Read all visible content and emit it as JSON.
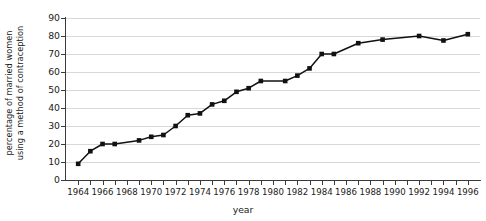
{
  "chart_data": {
    "type": "line",
    "title": "",
    "xlabel": "year",
    "ylabel": "percentage of married women using a method of contraception",
    "ylabel_line1": "percentage of married women",
    "ylabel_line2": "using a method of contraception",
    "xlim": [
      1963,
      1997
    ],
    "ylim": [
      0,
      90
    ],
    "y_ticks": [
      0,
      10,
      20,
      30,
      40,
      50,
      60,
      70,
      80,
      90
    ],
    "x_tick_years": [
      1964,
      1965,
      1966,
      1967,
      1968,
      1969,
      1970,
      1971,
      1972,
      1973,
      1974,
      1975,
      1976,
      1977,
      1978,
      1979,
      1980,
      1981,
      1982,
      1983,
      1984,
      1985,
      1986,
      1987,
      1988,
      1989,
      1990,
      1991,
      1992,
      1993,
      1994,
      1995,
      1996
    ],
    "x_tick_labels": [
      {
        "year": 1964,
        "label": "1964"
      },
      {
        "year": 1966,
        "label": "1966"
      },
      {
        "year": 1968,
        "label": "1968"
      },
      {
        "year": 1970,
        "label": "1970"
      },
      {
        "year": 1972,
        "label": "1972"
      },
      {
        "year": 1974,
        "label": "1974"
      },
      {
        "year": 1976,
        "label": "1976"
      },
      {
        "year": 1978,
        "label": "1978"
      },
      {
        "year": 1980,
        "label": "1980"
      },
      {
        "year": 1982,
        "label": "1982"
      },
      {
        "year": 1984,
        "label": "1984"
      },
      {
        "year": 1986,
        "label": "1986"
      },
      {
        "year": 1988,
        "label": "1988"
      },
      {
        "year": 1990,
        "label": "1990"
      },
      {
        "year": 1992,
        "label": "1992"
      },
      {
        "year": 1994,
        "label": "1994"
      },
      {
        "year": 1996,
        "label": "1996"
      }
    ],
    "grid": true,
    "grid_axis": "y",
    "legend": false,
    "marker": "square",
    "line_color": "#111111",
    "marker_color": "#111111",
    "grid_color": "#d8d8d8",
    "axis_color": "#3a3a3a",
    "x": [
      1964,
      1965,
      1966,
      1967,
      1969,
      1970,
      1971,
      1972,
      1973,
      1974,
      1975,
      1976,
      1977,
      1978,
      1979,
      1981,
      1982,
      1983,
      1984,
      1985,
      1987,
      1989,
      1992,
      1994,
      1996
    ],
    "values": [
      9,
      16,
      20,
      20,
      22,
      24,
      25,
      30,
      36,
      37,
      42,
      44,
      49,
      51,
      55,
      55,
      58,
      62,
      70,
      70,
      76,
      78,
      80,
      77.5,
      81
    ],
    "points": [
      {
        "year": 1964,
        "value": 9
      },
      {
        "year": 1965,
        "value": 16
      },
      {
        "year": 1966,
        "value": 20
      },
      {
        "year": 1967,
        "value": 20
      },
      {
        "year": 1969,
        "value": 22
      },
      {
        "year": 1970,
        "value": 24
      },
      {
        "year": 1971,
        "value": 25
      },
      {
        "year": 1972,
        "value": 30
      },
      {
        "year": 1973,
        "value": 36
      },
      {
        "year": 1974,
        "value": 37
      },
      {
        "year": 1975,
        "value": 42
      },
      {
        "year": 1976,
        "value": 44
      },
      {
        "year": 1977,
        "value": 49
      },
      {
        "year": 1978,
        "value": 51
      },
      {
        "year": 1979,
        "value": 55
      },
      {
        "year": 1981,
        "value": 55
      },
      {
        "year": 1982,
        "value": 58
      },
      {
        "year": 1983,
        "value": 62
      },
      {
        "year": 1984,
        "value": 70
      },
      {
        "year": 1985,
        "value": 70
      },
      {
        "year": 1987,
        "value": 76
      },
      {
        "year": 1989,
        "value": 78
      },
      {
        "year": 1992,
        "value": 80
      },
      {
        "year": 1994,
        "value": 77.5
      },
      {
        "year": 1996,
        "value": 81
      }
    ]
  }
}
